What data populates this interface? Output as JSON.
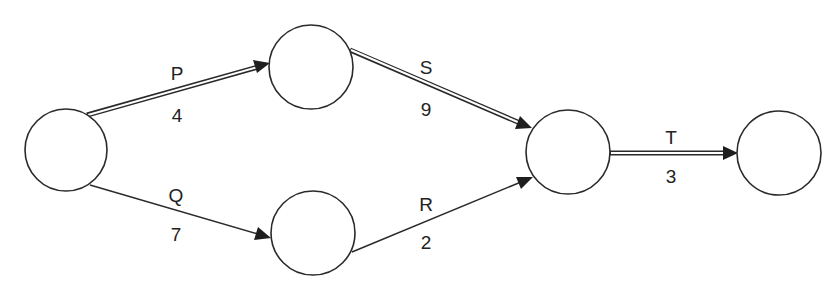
{
  "diagram": {
    "type": "activity-network",
    "nodes": [
      {
        "id": "n1",
        "cx": 66,
        "cy": 150,
        "r": 41
      },
      {
        "id": "n2",
        "cx": 311,
        "cy": 67,
        "r": 42
      },
      {
        "id": "n3",
        "cx": 313,
        "cy": 233,
        "r": 42
      },
      {
        "id": "n4",
        "cx": 568,
        "cy": 152,
        "r": 42
      },
      {
        "id": "n5",
        "cx": 779,
        "cy": 153,
        "r": 42
      }
    ],
    "edges": [
      {
        "id": "P",
        "label": "P",
        "duration": "4",
        "from": "n1",
        "to": "n2",
        "critical": true
      },
      {
        "id": "Q",
        "label": "Q",
        "duration": "7",
        "from": "n1",
        "to": "n3",
        "critical": false
      },
      {
        "id": "S",
        "label": "S",
        "duration": "9",
        "from": "n2",
        "to": "n4",
        "critical": true
      },
      {
        "id": "R",
        "label": "R",
        "duration": "2",
        "from": "n3",
        "to": "n4",
        "critical": false
      },
      {
        "id": "T",
        "label": "T",
        "duration": "3",
        "from": "n4",
        "to": "n5",
        "critical": true
      }
    ],
    "colors": {
      "line": "#2a2a2a",
      "background": "#ffffff"
    }
  }
}
